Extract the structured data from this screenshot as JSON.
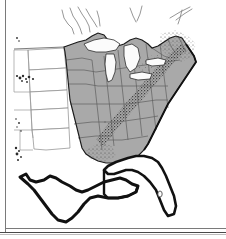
{
  "figure": {
    "description": "Outline map of the contiguous United States east of the Rocky Mountains, with states east of the Great Plains filled in gray. Texas and Florida are drawn with a heavy black outline but left unshaded. The Great Lakes are unshaded. Dense stippling appears along the Appalachian corridor and in New England.",
    "background_color": "#ffffff",
    "frame_color": "#7a7a7a"
  },
  "legend_symbols": {
    "shaded_region_label": "shaded states",
    "outlined_region_label": "heavy outlined states",
    "stipple_label": "point density stippling",
    "lake_label": "water body"
  },
  "style": {
    "land_fill": "#a9a9a9",
    "land_fill_light": "#b6b6b6",
    "unshaded_fill": "#ffffff",
    "state_border": "#5a5a5a",
    "thin_border": "#8a8a8a",
    "heavy_outline": "#111111",
    "coast_outline": "#1a1a1a",
    "lake_fill": "#fbfbfb",
    "stipple_color": "#2b2b2b"
  },
  "regions": {
    "shaded": [
      "Minnesota",
      "Iowa",
      "Missouri",
      "Arkansas",
      "Louisiana",
      "Wisconsin",
      "Illinois",
      "Michigan",
      "Indiana",
      "Ohio",
      "Kentucky",
      "Tennessee",
      "Mississippi",
      "Alabama",
      "Georgia",
      "South Carolina",
      "North Carolina",
      "Virginia",
      "West Virginia",
      "Maryland",
      "Delaware",
      "Pennsylvania",
      "New Jersey",
      "New York",
      "Connecticut",
      "Rhode Island",
      "Massachusetts",
      "Vermont",
      "New Hampshire",
      "Maine"
    ],
    "outlined_unshaded": [
      "Texas",
      "Florida"
    ],
    "thin_outline_unshaded": [
      "North Dakota",
      "South Dakota",
      "Nebraska",
      "Kansas",
      "Oklahoma"
    ],
    "water_bodies": [
      "Lake Superior",
      "Lake Michigan",
      "Lake Huron",
      "Lake Erie",
      "Lake Ontario",
      "Lake Okeechobee"
    ]
  }
}
